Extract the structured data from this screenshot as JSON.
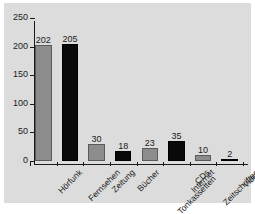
{
  "chart_data": {
    "type": "bar",
    "title": "",
    "subtitle": "",
    "xlabel": "",
    "ylabel": "",
    "ylim": [
      0,
      250
    ],
    "yticks": [
      0,
      50,
      100,
      150,
      200,
      250
    ],
    "grid": false,
    "legend": null,
    "categories": [
      "Hörfunk",
      "Fernsehen",
      "Zeitung",
      "Bücher",
      "CDs\nTonkassetten",
      "Internet",
      "Zeitschriften",
      "Video"
    ],
    "values": [
      202,
      205,
      30,
      18,
      23,
      35,
      10,
      2
    ],
    "bar_colors": [
      "#8c8c8c",
      "#090909",
      "#8c8c8c",
      "#090909",
      "#8c8c8c",
      "#090909",
      "#8c8c8c",
      "#090909"
    ],
    "data_labels": [
      "202",
      "205",
      "30",
      "18",
      "23",
      "35",
      "10",
      "2"
    ]
  },
  "axis": {
    "y_tick_labels": [
      "0",
      "50",
      "100",
      "150",
      "200",
      "250"
    ]
  },
  "categories_display": [
    {
      "line1": "Hörfunk",
      "line2": ""
    },
    {
      "line1": "Fernsehen",
      "line2": ""
    },
    {
      "line1": "Zeitung",
      "line2": ""
    },
    {
      "line1": "Bücher",
      "line2": ""
    },
    {
      "line1": "CDs",
      "line2": "Tonkassetten"
    },
    {
      "line1": "Internet",
      "line2": ""
    },
    {
      "line1": "Zeitschriften",
      "line2": ""
    },
    {
      "line1": "Video",
      "line2": ""
    }
  ],
  "colors": {
    "panel_background": "#dcdcdc",
    "page_background": "#ffffff",
    "axis": "#1a1a1a",
    "bar_gray": "#8c8c8c",
    "bar_black": "#090909",
    "text": "#1a1a1a"
  }
}
